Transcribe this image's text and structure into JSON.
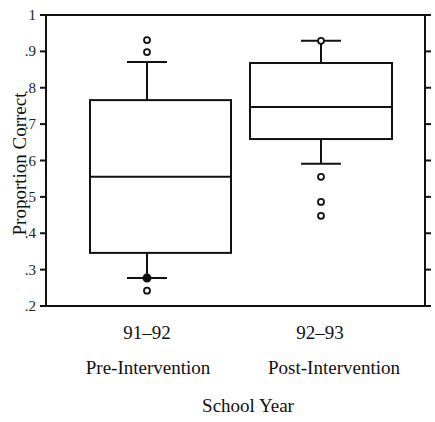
{
  "chart_data": {
    "type": "boxplot",
    "title": "",
    "xlabel": "School Year",
    "ylabel": "Proportion Correct",
    "ylim": [
      0.2,
      1.0
    ],
    "yticks": [
      0.2,
      0.3,
      0.4,
      0.5,
      0.6,
      0.7,
      0.8,
      0.9,
      1.0
    ],
    "ytick_labels": [
      ".2",
      ".3",
      ".4",
      ".5",
      ".6",
      ".7",
      ".8",
      ".9",
      "1"
    ],
    "grid": false,
    "legend": null,
    "categories": [
      "91–92",
      "92–93"
    ],
    "category_sublabels": [
      "Pre-Intervention",
      "Post-Intervention"
    ],
    "boxes": [
      {
        "name": "91–92 Pre-Intervention",
        "whisker_low": 0.277,
        "q1": 0.346,
        "median": 0.555,
        "q3": 0.766,
        "whisker_high": 0.871,
        "outliers": [
          0.931,
          0.898,
          0.242
        ],
        "filled_points": [
          0.277
        ]
      },
      {
        "name": "92–93 Post-Intervention",
        "whisker_low": 0.591,
        "q1": 0.659,
        "median": 0.747,
        "q3": 0.868,
        "whisker_high": 0.929,
        "outliers": [
          0.929,
          0.555,
          0.486,
          0.448
        ],
        "filled_points": []
      }
    ]
  },
  "labels": {
    "cat0": "91–92",
    "cat1": "92–93",
    "sub0": "Pre-Intervention",
    "sub1": "Post-Intervention",
    "xlabel": "School Year",
    "ylabel": "Proportion Correct"
  }
}
